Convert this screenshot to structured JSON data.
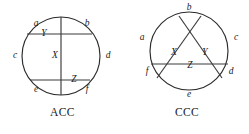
{
  "figure": {
    "diagrams": [
      {
        "id": "ACC",
        "caption": "ACC",
        "circle": {
          "cx": 61,
          "cy": 56,
          "r": 39
        },
        "boundary_labels": [
          {
            "text": "a",
            "x": 36,
            "y": 24
          },
          {
            "text": "b",
            "x": 87,
            "y": 24
          },
          {
            "text": "c",
            "x": 15,
            "y": 56
          },
          {
            "text": "d",
            "x": 108,
            "y": 56
          },
          {
            "text": "e",
            "x": 36,
            "y": 90
          },
          {
            "text": "f",
            "x": 87,
            "y": 90
          }
        ],
        "node_labels": [
          {
            "text": "X",
            "x": 55,
            "y": 56
          },
          {
            "text": "Y",
            "x": 44,
            "y": 34
          },
          {
            "text": "Z",
            "x": 74,
            "y": 80
          }
        ],
        "chords": [
          {
            "name": "vertical-chord",
            "x1": 61,
            "y1": 17,
            "x2": 61,
            "y2": 95
          },
          {
            "name": "upper-horizontal-chord",
            "x1": 27,
            "y1": 34,
            "x2": 92,
            "y2": 34
          },
          {
            "name": "lower-horizontal-chord",
            "x1": 30,
            "y1": 80,
            "x2": 90,
            "y2": 80
          }
        ]
      },
      {
        "id": "CCC",
        "caption": "CCC",
        "circle": {
          "cx": 64,
          "cy": 51,
          "r": 39
        },
        "boundary_labels": [
          {
            "text": "b",
            "x": 64,
            "y": 8
          },
          {
            "text": "a",
            "x": 17,
            "y": 38
          },
          {
            "text": "c",
            "x": 111,
            "y": 38
          },
          {
            "text": "f",
            "x": 22,
            "y": 72
          },
          {
            "text": "d",
            "x": 106,
            "y": 72
          },
          {
            "text": "e",
            "x": 64,
            "y": 95
          }
        ],
        "node_labels": [
          {
            "text": "X",
            "x": 49,
            "y": 53
          },
          {
            "text": "Y",
            "x": 80,
            "y": 53
          },
          {
            "text": "Z",
            "x": 65,
            "y": 66
          }
        ],
        "chords": [
          {
            "name": "chord-b-to-d",
            "x1": 54,
            "y1": 16,
            "x2": 97,
            "y2": 78
          },
          {
            "name": "chord-b-to-f",
            "x1": 76,
            "y1": 16,
            "x2": 32,
            "y2": 78
          },
          {
            "name": "chord-f-to-d",
            "x1": 26,
            "y1": 64,
            "x2": 103,
            "y2": 64
          }
        ]
      }
    ]
  },
  "colors": {
    "stroke": "#2b2b2b",
    "text": "#1a1a1a",
    "background": "#ffffff"
  }
}
